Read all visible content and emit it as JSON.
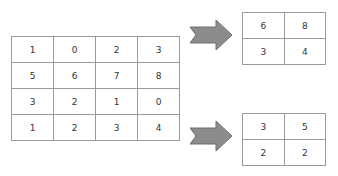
{
  "input_matrix": [
    [
      "1",
      "0",
      "2",
      "3"
    ],
    [
      "5",
      "6",
      "7",
      "8"
    ],
    [
      "3",
      "2",
      "1",
      "0"
    ],
    [
      "1",
      "2",
      "3",
      "4"
    ]
  ],
  "output_top": [
    [
      "6",
      "8"
    ],
    [
      "3",
      "4"
    ]
  ],
  "output_bottom": [
    [
      "3",
      "5"
    ],
    [
      "2",
      "2"
    ]
  ],
  "colors": {
    "arrow_fill": "#8c8c8c",
    "arrow_stroke": "#6e6e6e",
    "grid_line": "#9a9a9a"
  }
}
